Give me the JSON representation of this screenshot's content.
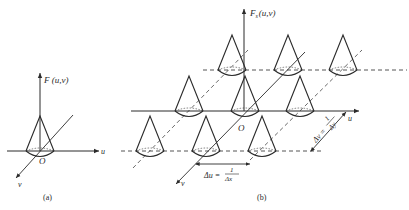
{
  "figure_a": {
    "vertical_axis_label": "F (u,v)",
    "u_axis_label": "u",
    "v_axis_label": "v",
    "origin_label": "O",
    "caption": "(a)"
  },
  "figure_b": {
    "vertical_axis_label_main": "F",
    "vertical_axis_label_sub": "s",
    "vertical_axis_label_args": "(u,v)",
    "u_axis_label": "u",
    "v_axis_label": "v",
    "origin_label": "O",
    "delta_u_label": "Δu =",
    "delta_u_num": "1",
    "delta_u_den": "Δx",
    "delta_v_label": "Δv =",
    "delta_v_num": "1",
    "delta_v_den": "Δy",
    "caption": "(b)"
  },
  "colors": {
    "line": "#2a2a2a",
    "background": "#ffffff"
  }
}
